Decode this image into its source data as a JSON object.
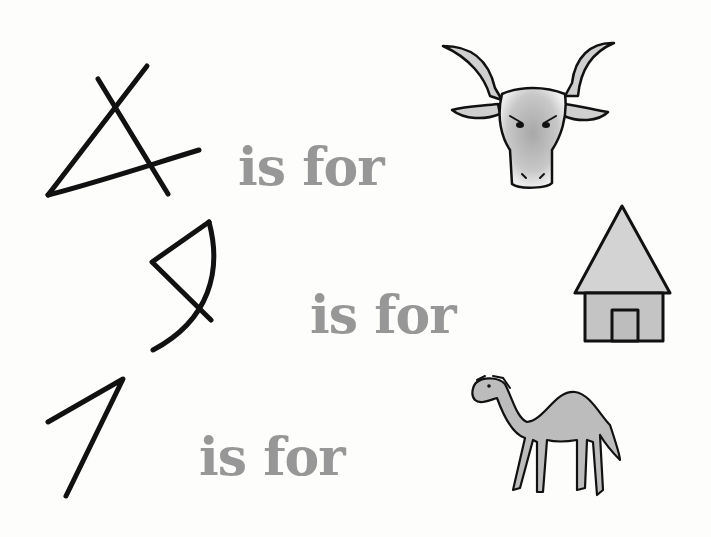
{
  "rows": [
    {
      "letter_glyph": "aleph-proto-sinaitic",
      "text": "is for",
      "picture": "ox-head",
      "picture_label": "ox"
    },
    {
      "letter_glyph": "bet-proto-sinaitic",
      "text": "is for",
      "picture": "house",
      "picture_label": "house"
    },
    {
      "letter_glyph": "gimel-proto-sinaitic",
      "text": "is for",
      "picture": "camel",
      "picture_label": "camel"
    }
  ],
  "colors": {
    "background": "#fdfdfc",
    "ink": "#111111",
    "text_gray": "#979797",
    "shade": "#b8b8b8"
  }
}
